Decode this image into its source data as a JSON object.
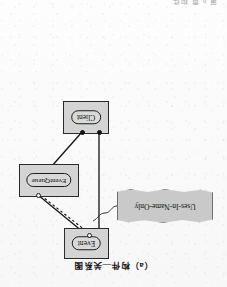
{
  "page": {
    "running_head": "第 6 章  构件",
    "caption": "（a）构件—关系图",
    "background_color": "#fbfbfb",
    "ink_color": "#111111",
    "node_fill": "#d4d4d4",
    "note_fill": "#c9c9c9"
  },
  "diagram": {
    "type": "component-relationship-diagram",
    "orientation": "upside-down-scan",
    "nodes": [
      {
        "id": "event",
        "label": "Event",
        "shape": "component-box"
      },
      {
        "id": "queue",
        "label": "EventQueue",
        "shape": "component-box"
      },
      {
        "id": "client",
        "label": "Client",
        "shape": "component-box"
      }
    ],
    "note": {
      "label": "Uses-In-Name-Only",
      "shape": "ribbon-banner",
      "anchor": "event-to-queue-dashed-link"
    },
    "edges": [
      {
        "id": "event-queue-solid",
        "from": "event",
        "to": "queue",
        "style": "solid",
        "from_marker": "open-circle",
        "to_marker": "open-circle"
      },
      {
        "id": "event-queue-dashed",
        "from": "event",
        "to": "queue",
        "style": "dashed",
        "from_marker": "open-circle",
        "to_marker": "open-circle"
      },
      {
        "id": "client-event",
        "from": "client",
        "to": "event",
        "style": "solid",
        "from_marker": "filled-dot",
        "to_marker": "none"
      },
      {
        "id": "client-queue",
        "from": "client",
        "to": "queue",
        "style": "solid",
        "from_marker": "filled-dot",
        "to_marker": "none"
      }
    ],
    "markers": {
      "filled_dot_name": "provided-port",
      "open_circle_name": "required-interface-socket"
    }
  }
}
